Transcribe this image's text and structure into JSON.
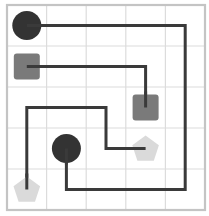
{
  "puzzle": {
    "type": "flow-connect",
    "grid": {
      "cols": 5,
      "rows": 5,
      "left": 7,
      "top": 5,
      "cell_w": 39.6,
      "cell_h": 41
    },
    "colors": {
      "background": "#ffffff",
      "grid_line": "#dcdcdc",
      "border": "#c4c4c4",
      "path": "#3a3a3a",
      "circle": "#333333",
      "square": "#7a7a7a",
      "pentagon": "#dadada"
    },
    "pieces": [
      {
        "id": "circle-a",
        "shape": "circle",
        "col": 0,
        "row": 0
      },
      {
        "id": "square-a",
        "shape": "square",
        "col": 0,
        "row": 1
      },
      {
        "id": "square-b",
        "shape": "square",
        "col": 3,
        "row": 2
      },
      {
        "id": "circle-b",
        "shape": "circle",
        "col": 1,
        "row": 3
      },
      {
        "id": "pentagon-a",
        "shape": "pentagon",
        "col": 3,
        "row": 3
      },
      {
        "id": "pentagon-b",
        "shape": "pentagon",
        "col": 0,
        "row": 4
      }
    ],
    "paths": [
      {
        "id": "circle-path",
        "cells": [
          [
            0,
            0
          ],
          [
            4,
            0
          ],
          [
            4,
            4
          ],
          [
            1,
            4
          ],
          [
            1,
            3
          ]
        ]
      },
      {
        "id": "square-path",
        "cells": [
          [
            0,
            1
          ],
          [
            3,
            1
          ],
          [
            3,
            2
          ]
        ]
      },
      {
        "id": "pentagon-path",
        "cells": [
          [
            0,
            4
          ],
          [
            0,
            2
          ],
          [
            2,
            2
          ],
          [
            2,
            3
          ],
          [
            3,
            3
          ]
        ]
      }
    ]
  }
}
